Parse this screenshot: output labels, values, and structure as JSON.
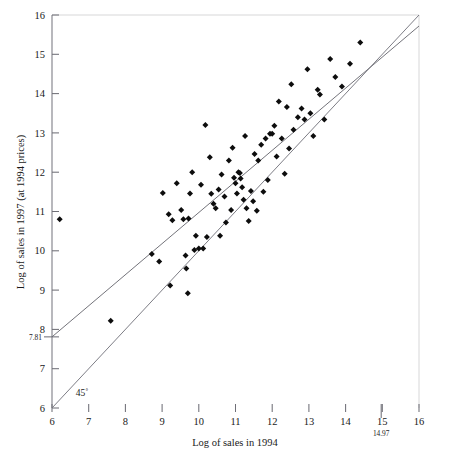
{
  "chart_data": {
    "type": "scatter",
    "title": "",
    "xlabel": "Log of sales in 1994",
    "ylabel": "Log of sales in 1997 (at 1994 prices)",
    "xlim": [
      6,
      16
    ],
    "ylim": [
      6,
      16
    ],
    "grid": false,
    "legend": null,
    "x_ticks": [
      6,
      7,
      8,
      9,
      10,
      11,
      12,
      13,
      14,
      15,
      16
    ],
    "x_tick_labels": [
      "6",
      "7",
      "8",
      "9",
      "10",
      "11",
      "12",
      "13",
      "14",
      "15",
      "16"
    ],
    "y_ticks": [
      6,
      7,
      8,
      9,
      10,
      11,
      12,
      13,
      14,
      15,
      16
    ],
    "y_tick_labels": [
      "6",
      "7",
      "8",
      "9",
      "10",
      "11",
      "12",
      "13",
      "14",
      "15",
      "16"
    ],
    "special_x_tick": {
      "value": 14.97,
      "label": "14.97"
    },
    "special_y_tick": {
      "value": 7.81,
      "label": "7.81"
    },
    "annotations": [
      {
        "text": "45˚",
        "x": 6.65,
        "y": 6.3,
        "name": "forty-five-degree-label"
      }
    ],
    "lines": [
      {
        "name": "regression-line",
        "kind": "fit",
        "x0": 6.0,
        "y0": 7.81,
        "x1": 16.0,
        "y1": 15.72
      },
      {
        "name": "forty-five-degree-line",
        "kind": "reference",
        "x0": 6.0,
        "y0": 6.0,
        "x1": 16.0,
        "y1": 16.0
      }
    ],
    "points": [
      [
        6.21,
        10.8
      ],
      [
        7.6,
        8.22
      ],
      [
        8.72,
        9.92
      ],
      [
        8.92,
        9.73
      ],
      [
        9.02,
        11.47
      ],
      [
        9.18,
        10.93
      ],
      [
        9.22,
        9.12
      ],
      [
        9.28,
        10.78
      ],
      [
        9.4,
        11.72
      ],
      [
        9.52,
        11.04
      ],
      [
        9.58,
        10.8
      ],
      [
        9.64,
        9.88
      ],
      [
        9.66,
        9.55
      ],
      [
        9.7,
        8.92
      ],
      [
        9.72,
        10.82
      ],
      [
        9.76,
        11.46
      ],
      [
        9.82,
        12.0
      ],
      [
        9.88,
        10.02
      ],
      [
        9.92,
        10.38
      ],
      [
        10.0,
        10.06
      ],
      [
        10.06,
        11.68
      ],
      [
        10.12,
        10.06
      ],
      [
        10.18,
        13.2
      ],
      [
        10.22,
        10.35
      ],
      [
        10.3,
        12.38
      ],
      [
        10.34,
        11.45
      ],
      [
        10.4,
        11.2
      ],
      [
        10.46,
        11.08
      ],
      [
        10.54,
        11.56
      ],
      [
        10.58,
        10.38
      ],
      [
        10.62,
        11.94
      ],
      [
        10.7,
        11.38
      ],
      [
        10.74,
        10.72
      ],
      [
        10.82,
        12.3
      ],
      [
        10.88,
        11.04
      ],
      [
        10.92,
        12.62
      ],
      [
        10.96,
        11.86
      ],
      [
        11.0,
        11.72
      ],
      [
        11.04,
        11.46
      ],
      [
        11.08,
        12.0
      ],
      [
        11.12,
        11.98
      ],
      [
        11.14,
        11.84
      ],
      [
        11.18,
        11.62
      ],
      [
        11.22,
        11.3
      ],
      [
        11.26,
        12.92
      ],
      [
        11.3,
        11.08
      ],
      [
        11.36,
        10.76
      ],
      [
        11.42,
        11.52
      ],
      [
        11.48,
        11.26
      ],
      [
        11.52,
        12.46
      ],
      [
        11.58,
        11.02
      ],
      [
        11.62,
        12.3
      ],
      [
        11.7,
        12.7
      ],
      [
        11.76,
        11.5
      ],
      [
        11.82,
        12.86
      ],
      [
        11.88,
        11.8
      ],
      [
        11.94,
        12.98
      ],
      [
        12.0,
        12.98
      ],
      [
        12.06,
        13.18
      ],
      [
        12.12,
        12.4
      ],
      [
        12.18,
        13.8
      ],
      [
        12.26,
        12.86
      ],
      [
        12.34,
        11.96
      ],
      [
        12.4,
        13.66
      ],
      [
        12.46,
        12.6
      ],
      [
        12.52,
        14.24
      ],
      [
        12.58,
        13.08
      ],
      [
        12.7,
        13.4
      ],
      [
        12.8,
        13.62
      ],
      [
        12.88,
        13.34
      ],
      [
        12.96,
        14.62
      ],
      [
        13.04,
        13.5
      ],
      [
        13.12,
        12.92
      ],
      [
        13.24,
        14.1
      ],
      [
        13.3,
        13.98
      ],
      [
        13.42,
        13.34
      ],
      [
        13.58,
        14.88
      ],
      [
        13.72,
        14.42
      ],
      [
        13.9,
        14.18
      ],
      [
        14.12,
        14.76
      ],
      [
        14.4,
        15.3
      ]
    ]
  },
  "axis_accent_colors": {
    "x_axis_left": "#6f7fae",
    "x_axis_mid": "#b09a78",
    "x_axis_right": "#c29098"
  }
}
